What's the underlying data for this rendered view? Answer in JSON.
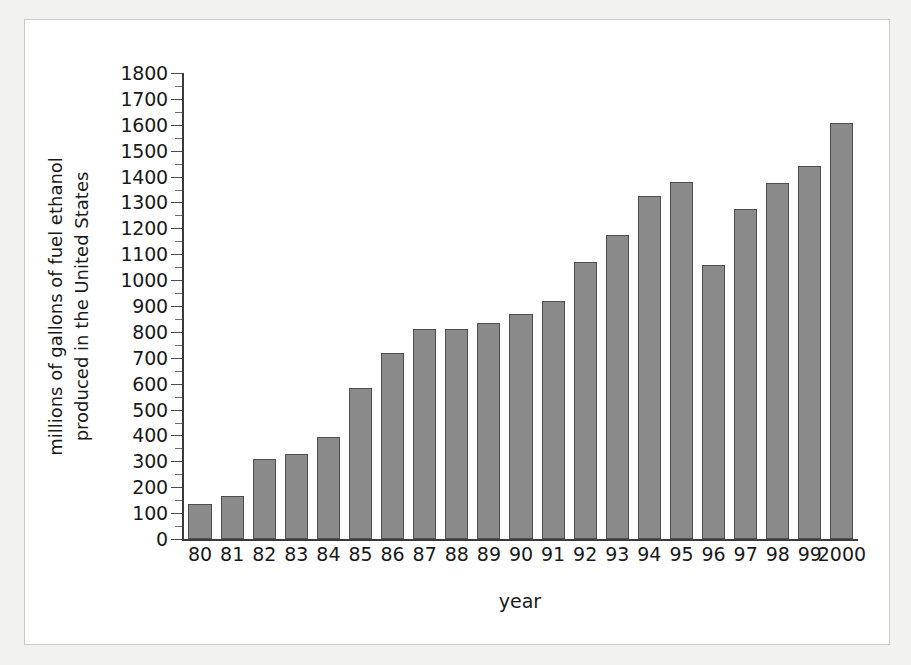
{
  "chart_data": {
    "type": "bar",
    "title": "",
    "xlabel": "year",
    "ylabel": "millions of gallons of fuel ethanol\nproduced in the United States",
    "categories": [
      "80",
      "81",
      "82",
      "83",
      "84",
      "85",
      "86",
      "87",
      "88",
      "89",
      "90",
      "91",
      "92",
      "93",
      "94",
      "95",
      "96",
      "97",
      "98",
      "99",
      "2000"
    ],
    "values": [
      135,
      165,
      310,
      330,
      395,
      585,
      720,
      810,
      810,
      835,
      870,
      920,
      1070,
      1175,
      1325,
      1380,
      1060,
      1275,
      1375,
      1440,
      1605
    ],
    "ylim": [
      0,
      1800
    ],
    "xlim_note": "21 year categories, 1980 through 2000",
    "ytick_labels": [
      "0",
      "100",
      "200",
      "300",
      "400",
      "500",
      "600",
      "700",
      "800",
      "900",
      "1000",
      "1100",
      "1200",
      "1300",
      "1400",
      "1500",
      "1600",
      "1700",
      "1800"
    ],
    "ytick_values": [
      0,
      100,
      200,
      300,
      400,
      500,
      600,
      700,
      800,
      900,
      1000,
      1100,
      1200,
      1300,
      1400,
      1500,
      1600,
      1700,
      1800
    ],
    "minor_tick_interval": 50,
    "grid": false,
    "legend": false,
    "bar_color": "#8a8a8a",
    "bar_edge_color": "#4e4e4e",
    "axis_color": "#3a3a3a",
    "background_color": "#ffffff",
    "page_background_color": "#f2f2f0"
  }
}
